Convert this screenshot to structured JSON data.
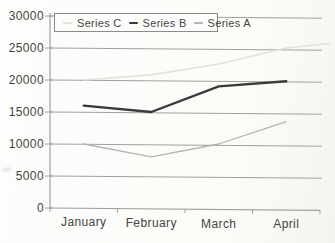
{
  "chart_data": {
    "type": "line",
    "categories": [
      "January",
      "February",
      "March",
      "April"
    ],
    "series": [
      {
        "name": "Series C",
        "values": [
          20000,
          20800,
          22500,
          25000
        ],
        "color": "#e1e1dd",
        "width": 1.6,
        "extends_past_last_category": true,
        "edge_value": 25700
      },
      {
        "name": "Series B",
        "values": [
          16000,
          15000,
          19000,
          19800
        ],
        "color": "#3a3a3a",
        "width": 2.4,
        "extends_past_last_category": false,
        "edge_value": null
      },
      {
        "name": "Series A",
        "values": [
          10000,
          8000,
          10000,
          13500
        ],
        "color": "#b3b3b1",
        "width": 1.3,
        "extends_past_last_category": false,
        "edge_value": null
      }
    ],
    "title": "",
    "xlabel": "",
    "ylabel": "",
    "ylim": [
      0,
      30000
    ],
    "ytick_step": 5000,
    "ytick_labels": [
      "0",
      "5000",
      "10000",
      "15000",
      "20000",
      "25000",
      "30000"
    ],
    "grid": true,
    "legend_position": "top-left"
  },
  "colors": {
    "axis": "#a0a09e",
    "label_text": "#454542",
    "legend_border": "#8b8b89",
    "legend_background": "#fdfdfc",
    "page_background": "#fbfbf9"
  }
}
